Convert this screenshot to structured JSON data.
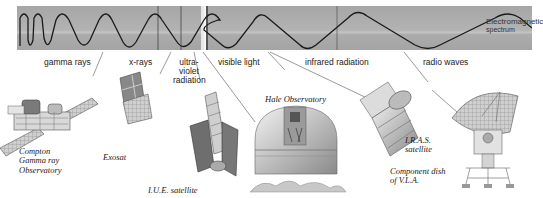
{
  "figure": {
    "title": "Electromagnetic spectrum",
    "band_color": "#a9a9a9",
    "wave_color": "#1a1a1a"
  },
  "spectrum_label": {
    "line1": "Electromagnetic",
    "line2": "spectrum"
  },
  "bands": [
    {
      "id": "gamma",
      "label": "gamma rays"
    },
    {
      "id": "xray",
      "label": "x-rays"
    },
    {
      "id": "uv",
      "label_lines": [
        "ultra-",
        "violet",
        "radiation"
      ]
    },
    {
      "id": "visible",
      "label": "visible light"
    },
    {
      "id": "infrared",
      "label": "infrared radiation"
    },
    {
      "id": "radio",
      "label": "radio waves"
    }
  ],
  "instruments": [
    {
      "id": "compton",
      "caption_lines": [
        "Compton",
        "Gamma ray",
        "Observatory"
      ]
    },
    {
      "id": "exosat",
      "caption_lines": [
        "Exosat"
      ]
    },
    {
      "id": "iue",
      "caption_lines": [
        "I.U.E. satellite"
      ]
    },
    {
      "id": "hale",
      "caption_lines": [
        "Hale Observatory"
      ]
    },
    {
      "id": "iras",
      "caption_lines": [
        "I.R.A.S.",
        "satellite"
      ]
    },
    {
      "id": "vla",
      "caption_lines": [
        "Component dish",
        "of V.L.A."
      ]
    }
  ]
}
